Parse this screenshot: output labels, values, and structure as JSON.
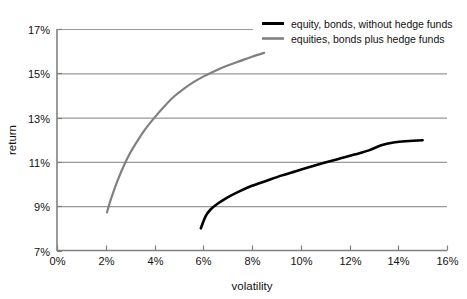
{
  "chart_data": {
    "type": "line",
    "title": "",
    "xlabel": "volatility",
    "ylabel": "return",
    "xlim": [
      0,
      16
    ],
    "ylim": [
      7,
      17
    ],
    "xticks": [
      "0%",
      "2%",
      "4%",
      "6%",
      "8%",
      "10%",
      "12%",
      "14%",
      "16%"
    ],
    "yticks": [
      "7%",
      "9%",
      "11%",
      "13%",
      "15%",
      "17%"
    ],
    "xtick_values": [
      0,
      2,
      4,
      6,
      8,
      10,
      12,
      14,
      16
    ],
    "ytick_values": [
      7,
      9,
      11,
      13,
      15,
      17
    ],
    "grid": "horizontal",
    "legend_position": "top-right",
    "series": [
      {
        "name": "equity, bonds, without hedge funds",
        "color": "#000000",
        "width": 2.6,
        "points": [
          [
            5.9,
            8.0
          ],
          [
            6.1,
            8.55
          ],
          [
            6.3,
            8.85
          ],
          [
            6.6,
            9.12
          ],
          [
            7.0,
            9.4
          ],
          [
            7.5,
            9.68
          ],
          [
            8.0,
            9.92
          ],
          [
            8.6,
            10.15
          ],
          [
            9.2,
            10.38
          ],
          [
            9.8,
            10.58
          ],
          [
            10.4,
            10.78
          ],
          [
            11.0,
            10.97
          ],
          [
            11.6,
            11.15
          ],
          [
            12.2,
            11.33
          ],
          [
            12.8,
            11.52
          ],
          [
            13.3,
            11.75
          ],
          [
            13.8,
            11.88
          ],
          [
            14.3,
            11.93
          ],
          [
            15.0,
            11.98
          ]
        ]
      },
      {
        "name": "equities, bonds plus hedge funds",
        "color": "#808080",
        "width": 2.2,
        "points": [
          [
            2.05,
            8.72
          ],
          [
            2.15,
            9.1
          ],
          [
            2.3,
            9.6
          ],
          [
            2.5,
            10.2
          ],
          [
            2.75,
            10.85
          ],
          [
            3.0,
            11.4
          ],
          [
            3.3,
            11.95
          ],
          [
            3.6,
            12.45
          ],
          [
            4.0,
            13.0
          ],
          [
            4.4,
            13.5
          ],
          [
            4.8,
            13.95
          ],
          [
            5.2,
            14.3
          ],
          [
            5.6,
            14.6
          ],
          [
            6.0,
            14.85
          ],
          [
            6.5,
            15.12
          ],
          [
            7.0,
            15.35
          ],
          [
            7.5,
            15.55
          ],
          [
            8.0,
            15.75
          ],
          [
            8.5,
            15.92
          ]
        ]
      }
    ]
  },
  "legend": {
    "entries": [
      {
        "label": "equity, bonds, without hedge funds"
      },
      {
        "label": "equities, bonds plus hedge funds"
      }
    ]
  },
  "axes": {
    "x_title": "volatility",
    "y_title": "return"
  },
  "colors": {
    "series_black": "#000000",
    "series_gray": "#808080",
    "grid": "#999999",
    "axis": "#808080",
    "background": "#ffffff"
  }
}
